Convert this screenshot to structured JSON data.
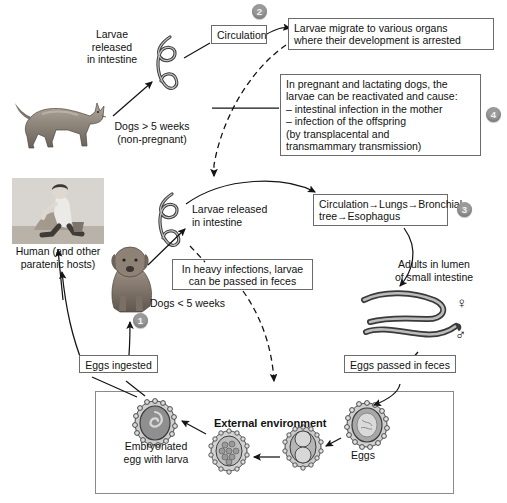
{
  "figure": {
    "type": "biological-life-cycle-diagram"
  },
  "steps": {
    "one": "1",
    "two": "2",
    "three": "3",
    "four": "4"
  },
  "labels": {
    "larvae_released_top": "Larvae\nreleased\nin intestine",
    "dogs_over_5_weeks": "Dogs > 5 weeks\n(non-pregnant)",
    "human_paratenic": "Human (and other\nparatenic hosts)",
    "larvae_released_mid": "Larvae released\nin intestine",
    "dogs_under_5_weeks": "Dogs < 5 weeks",
    "adults_in_lumen": "Adults in lumen\nof small intestine",
    "external_environment": "External environment",
    "embryonated_egg": "Embryonated\negg with larva",
    "eggs": "Eggs",
    "female_symbol": "♀",
    "male_symbol": "♂"
  },
  "boxes": {
    "circulation": "Circulation",
    "larvae_migrate": "Larvae migrate to various organs\nwhere their development is arrested",
    "pregnant_lactating": "In pregnant and lactating dogs, the\nlarvae can be reactivated and cause:\n– intestinal infection in the mother\n– infection of the offspring\n   (by transplacental and\n   transmammary transmission)",
    "circulation_lungs": "Circulation→Lungs→Bronchial\ntree→Esophagus",
    "heavy_infections": "In heavy infections, larvae\ncan be passed in feces",
    "eggs_ingested": "Eggs ingested",
    "eggs_passed": "Eggs passed in feces"
  },
  "colors": {
    "badge_fill": "#9a9a9a",
    "box_border": "#6b6b6b",
    "arrow": "#1a1a1a",
    "worm_fill": "#b8b8b8",
    "worm_outline": "#3a3a3a",
    "egg_shell": "#cfcfcf",
    "egg_core": "#9e9e9e",
    "panel_border": "#8a8a8a",
    "background": "#ffffff"
  }
}
